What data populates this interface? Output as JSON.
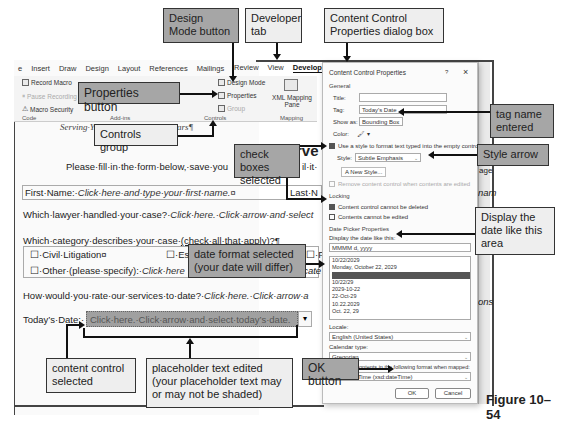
{
  "ribbon": {
    "tabs": [
      "e",
      "Insert",
      "Draw",
      "Design",
      "Layout",
      "References",
      "Mailings",
      "Review",
      "View",
      "Developer",
      "Help"
    ],
    "active_tab": "Developer",
    "code_group": {
      "label": "Code",
      "items": [
        "Record Macro",
        "Pause Recording",
        "Macro Security"
      ]
    },
    "addins_group": {
      "label": "Add-ins"
    },
    "controls_group": {
      "label": "Controls",
      "items": [
        "Design Mode",
        "Properties",
        "Group"
      ]
    },
    "mapping_group": {
      "label": "Mapping",
      "items": [
        "XML Mapping Pane"
      ]
    }
  },
  "document": {
    "tagline": "Serving·You·for·More·than·35·Years¶",
    "heading_fragment": "rve",
    "intro": "Please·fill·in·the·form·below,·save·you",
    "intro_tail": "il·it·",
    "first_name_label": "First·Name:·",
    "first_name_placeholder": "Click·here·and·type·your·first·name.¤",
    "last_name_label": "Last·N",
    "last_name_tail": "nam",
    "lawyer_question": "Which·lawyer·handled·your·case?·",
    "lawyer_placeholder": "Click·here.·Click·arrow·and·select",
    "lawyer_tail": "age",
    "category_question": "Which·category·describes·your·case·",
    "category_hint": "(check·all·that·apply)?¶",
    "checkboxes": [
      "☐·Civil·Litigation¤",
      "☐·Es",
      "☐·Pe"
    ],
    "other_label": "☐·Other·(please·specify):·",
    "other_placeholder": "Click·here",
    "other_tail": "·cate",
    "rate_question": "How·would·you·rate·our·services·to·date?·",
    "rate_placeholder": "Click·here.·Click·arrow·a",
    "rate_tail": "ons",
    "date_label": "Today’s·Date:·",
    "date_placeholder": "Click·here.·Click·arrow·and·select·today’s·date.",
    "date_dropdown": "▾"
  },
  "dialog": {
    "title": "Content Control Properties",
    "help": "?",
    "close": "×",
    "general_label": "General",
    "title_label": "Title:",
    "title_value": "",
    "tag_label": "Tag:",
    "tag_value": "Today's Date",
    "show_as_label": "Show as:",
    "show_as_value": "Bounding Box",
    "color_label": "Color:",
    "use_style_label": "Use a style to format text typed into the empty control",
    "use_style_checked": true,
    "style_label": "Style:",
    "style_value": "Subtle Emphasis",
    "new_style_label": "New Style...",
    "remove_label": "Remove content control when contents are edited",
    "locking_label": "Locking",
    "cannot_delete_label": "Content control cannot be deleted",
    "cannot_delete_checked": true,
    "cannot_edit_label": "Contents cannot be edited",
    "cannot_edit_checked": false,
    "date_picker_label": "Date Picker Properties",
    "display_label": "Display the date like this:",
    "display_value": "MMMM d, yyyy",
    "date_formats": [
      "10/22/2029",
      "Monday, October 22, 2029",
      "October 22, 2029",
      "10/22/29",
      "2029-10-22",
      "22-Oct-29",
      "10.22.2029",
      "Oct. 22, 29"
    ],
    "selected_format_index": 2,
    "locale_label": "Locale:",
    "locale_value": "English (United States)",
    "calendar_label": "Calendar type:",
    "calendar_value": "Gregorian",
    "store_label": "Store XML contents in the following format when mapped:",
    "store_value": "Date and Time (xsd:dateTime)",
    "ok_label": "OK",
    "cancel_label": "Cancel"
  },
  "callouts": {
    "design_mode": "Design Mode button",
    "developer_tab": "Developer tab",
    "ccp_dialog": "Content Control Properties dialog box",
    "properties_button": "Properties button",
    "tag_name": "tag name entered",
    "controls_group": "Controls group",
    "check_boxes": "check boxes selected",
    "style_arrow": "Style arrow",
    "display_date": "Display the date like this area",
    "date_format": "date format selected (your date will differ)",
    "content_control": "content control selected",
    "placeholder_text": "placeholder text edited (your placeholder text may or may not be shaded)",
    "ok_button": "OK button"
  },
  "figure_label": "Figure 10–54"
}
